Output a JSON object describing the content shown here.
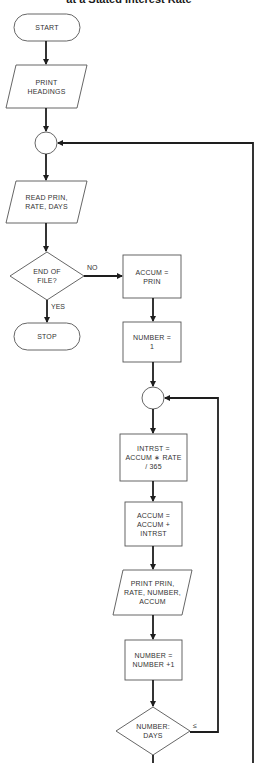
{
  "title": "at a Stated Interest Rate",
  "nodes": {
    "start": "START",
    "print_headings": "PRINT\nHEADINGS",
    "read": "READ PRIN,\nRATE, DAYS",
    "end_of_file": "END OF\nFILE?",
    "stop": "STOP",
    "accum_prin": "ACCUM =\nPRIN",
    "number_1": "NUMBER =\n1",
    "intrst": "INTRST =\nACCUM ∗ RATE\n/ 365",
    "accum_add": "ACCUM =\nACCUM +\nINTRST",
    "print_line": "PRINT PRIN,\nRATE, NUMBER,\nACCUM",
    "number_inc": "NUMBER =\nNUMBER +1",
    "number_days": "NUMBER:\nDAYS"
  },
  "edges": {
    "no": "NO",
    "yes": "YES",
    "less_equal": "≤"
  },
  "colors": {
    "line": "#1e1e1e",
    "shape_stroke": "#555555",
    "background": "#ffffff"
  }
}
